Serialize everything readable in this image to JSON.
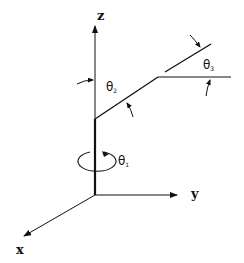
{
  "diagram": {
    "type": "robot-arm-kinematics",
    "colors": {
      "ink": "#111111",
      "background": "#ffffff"
    },
    "axes": {
      "z": {
        "label": "z"
      },
      "y": {
        "label": "y"
      },
      "x": {
        "label": "x"
      }
    },
    "joints": [
      {
        "id": "theta1",
        "symbol": "θ",
        "subscript": "1"
      },
      {
        "id": "theta2",
        "symbol": "θ",
        "subscript": "2"
      },
      {
        "id": "theta3",
        "symbol": "θ",
        "subscript": "3"
      }
    ]
  }
}
